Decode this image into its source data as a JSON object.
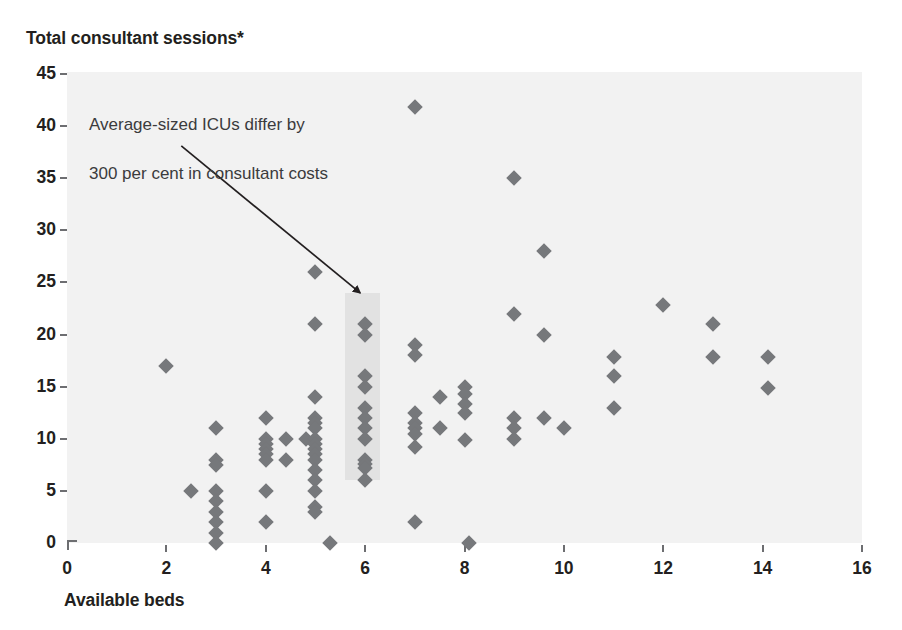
{
  "chart_data": {
    "type": "scatter",
    "title": "",
    "ylabel": "Total consultant sessions*",
    "xlabel": "Available beds",
    "xlim": [
      0,
      16
    ],
    "ylim": [
      0,
      45
    ],
    "xticks": [
      0,
      2,
      4,
      6,
      8,
      10,
      12,
      14,
      16
    ],
    "yticks": [
      0,
      5,
      10,
      15,
      20,
      25,
      30,
      35,
      40,
      45
    ],
    "xtick_labels": [
      "0",
      "2",
      "4",
      "6",
      "8",
      "10",
      "12",
      "14",
      "16"
    ],
    "ytick_labels": [
      "0",
      "5",
      "10",
      "15",
      "20",
      "25",
      "30",
      "35",
      "40",
      "45"
    ],
    "grid": false,
    "legend": "none",
    "marker": "diamond",
    "marker_color": "#76787b",
    "plot_background": "#f2f2f2",
    "highlight_band": {
      "x_center": 6,
      "x_from": 5.6,
      "x_to": 6.3,
      "y_from": 6,
      "y_to": 24,
      "color": "#e2e2e2"
    },
    "annotation": {
      "line1": "Average-sized ICUs differ by",
      "line2": "300 per cent in consultant costs",
      "arrow_from": [
        2.3,
        38.1
      ],
      "arrow_to": [
        5.9,
        24.0
      ],
      "arrow_color": "#231f20"
    },
    "points": [
      {
        "x": 2.0,
        "y": 17.0
      },
      {
        "x": 2.5,
        "y": 5.0
      },
      {
        "x": 3.0,
        "y": 11.0
      },
      {
        "x": 3.0,
        "y": 8.0
      },
      {
        "x": 3.0,
        "y": 7.5
      },
      {
        "x": 3.0,
        "y": 5.0
      },
      {
        "x": 3.0,
        "y": 4.0
      },
      {
        "x": 3.0,
        "y": 3.0
      },
      {
        "x": 3.0,
        "y": 2.0
      },
      {
        "x": 3.0,
        "y": 1.0
      },
      {
        "x": 3.0,
        "y": 0.0
      },
      {
        "x": 4.0,
        "y": 12.0
      },
      {
        "x": 4.0,
        "y": 10.0
      },
      {
        "x": 4.0,
        "y": 9.5
      },
      {
        "x": 4.0,
        "y": 9.0
      },
      {
        "x": 4.0,
        "y": 8.5
      },
      {
        "x": 4.0,
        "y": 8.0
      },
      {
        "x": 4.0,
        "y": 5.0
      },
      {
        "x": 4.0,
        "y": 2.0
      },
      {
        "x": 4.4,
        "y": 10.0
      },
      {
        "x": 4.4,
        "y": 8.0
      },
      {
        "x": 4.8,
        "y": 10.0
      },
      {
        "x": 5.0,
        "y": 26.0
      },
      {
        "x": 5.0,
        "y": 21.0
      },
      {
        "x": 5.0,
        "y": 14.0
      },
      {
        "x": 5.0,
        "y": 12.0
      },
      {
        "x": 5.0,
        "y": 11.5
      },
      {
        "x": 5.0,
        "y": 11.0
      },
      {
        "x": 5.0,
        "y": 10.0
      },
      {
        "x": 5.0,
        "y": 9.5
      },
      {
        "x": 5.0,
        "y": 9.0
      },
      {
        "x": 5.0,
        "y": 8.5
      },
      {
        "x": 5.0,
        "y": 8.0
      },
      {
        "x": 5.0,
        "y": 7.0
      },
      {
        "x": 5.0,
        "y": 6.0
      },
      {
        "x": 5.0,
        "y": 5.0
      },
      {
        "x": 5.0,
        "y": 3.5
      },
      {
        "x": 5.0,
        "y": 3.0
      },
      {
        "x": 5.3,
        "y": 0.0
      },
      {
        "x": 6.0,
        "y": 21.0
      },
      {
        "x": 6.0,
        "y": 20.0
      },
      {
        "x": 6.0,
        "y": 16.0
      },
      {
        "x": 6.0,
        "y": 15.0
      },
      {
        "x": 6.0,
        "y": 13.0
      },
      {
        "x": 6.0,
        "y": 12.0
      },
      {
        "x": 6.0,
        "y": 11.0
      },
      {
        "x": 6.0,
        "y": 10.0
      },
      {
        "x": 6.0,
        "y": 8.0
      },
      {
        "x": 6.0,
        "y": 7.6
      },
      {
        "x": 6.0,
        "y": 7.2
      },
      {
        "x": 6.0,
        "y": 6.0
      },
      {
        "x": 7.0,
        "y": 41.8
      },
      {
        "x": 7.0,
        "y": 19.0
      },
      {
        "x": 7.0,
        "y": 18.0
      },
      {
        "x": 7.0,
        "y": 12.5
      },
      {
        "x": 7.0,
        "y": 11.5
      },
      {
        "x": 7.0,
        "y": 11.0
      },
      {
        "x": 7.0,
        "y": 10.5
      },
      {
        "x": 7.0,
        "y": 9.2
      },
      {
        "x": 7.0,
        "y": 2.0
      },
      {
        "x": 7.5,
        "y": 14.0
      },
      {
        "x": 7.5,
        "y": 11.0
      },
      {
        "x": 8.0,
        "y": 15.0
      },
      {
        "x": 8.0,
        "y": 14.3
      },
      {
        "x": 8.0,
        "y": 13.3
      },
      {
        "x": 8.0,
        "y": 12.5
      },
      {
        "x": 8.0,
        "y": 9.9
      },
      {
        "x": 8.1,
        "y": 0.0
      },
      {
        "x": 9.0,
        "y": 35.0
      },
      {
        "x": 9.0,
        "y": 22.0
      },
      {
        "x": 9.0,
        "y": 12.0
      },
      {
        "x": 9.0,
        "y": 11.0
      },
      {
        "x": 9.0,
        "y": 10.0
      },
      {
        "x": 9.6,
        "y": 28.0
      },
      {
        "x": 9.6,
        "y": 20.0
      },
      {
        "x": 9.6,
        "y": 12.0
      },
      {
        "x": 10.0,
        "y": 11.0
      },
      {
        "x": 11.0,
        "y": 17.8
      },
      {
        "x": 11.0,
        "y": 16.0
      },
      {
        "x": 11.0,
        "y": 13.0
      },
      {
        "x": 12.0,
        "y": 22.8
      },
      {
        "x": 13.0,
        "y": 21.0
      },
      {
        "x": 13.0,
        "y": 17.8
      },
      {
        "x": 14.1,
        "y": 17.8
      },
      {
        "x": 14.1,
        "y": 14.9
      }
    ]
  }
}
